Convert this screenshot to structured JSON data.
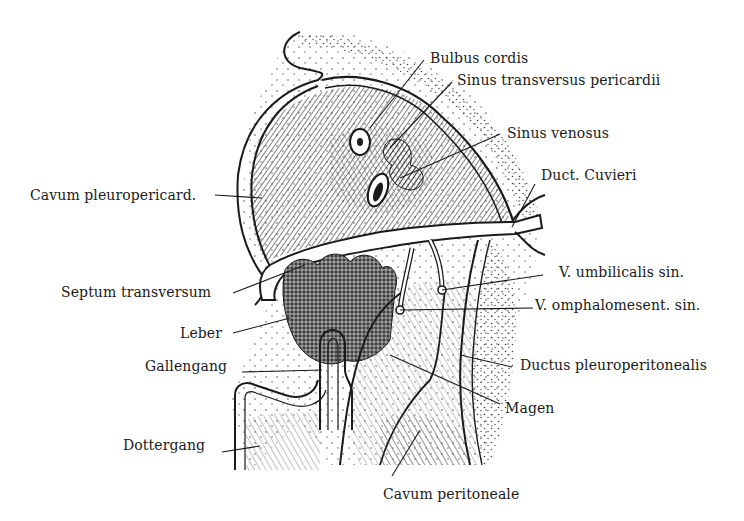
{
  "figure": {
    "type": "anatomical-illustration",
    "labels": [
      {
        "id": "bulbus-cordis",
        "text": "Bulbus cordis",
        "x": 430,
        "y": 50,
        "leader": [
          [
            424,
            60
          ],
          [
            370,
            128
          ]
        ]
      },
      {
        "id": "sinus-transversus-pericardii",
        "text": "Sinus transversus pericardii",
        "x": 457,
        "y": 72,
        "leader": [
          [
            452,
            82
          ],
          [
            390,
            148
          ]
        ]
      },
      {
        "id": "sinus-venosus",
        "text": "Sinus venosus",
        "x": 507,
        "y": 125,
        "leader": [
          [
            500,
            134
          ],
          [
            400,
            178
          ]
        ]
      },
      {
        "id": "duct-cuvieri",
        "text": "Duct. Cuvieri",
        "x": 541,
        "y": 167,
        "leader": [
          [
            535,
            184
          ],
          [
            512,
            227
          ]
        ]
      },
      {
        "id": "cavum-pleuropericard",
        "text": "Cavum pleuropericard.",
        "x": 30,
        "y": 187,
        "leader": [
          [
            215,
            195
          ],
          [
            262,
            198
          ]
        ]
      },
      {
        "id": "v-umbilicalis-sin",
        "text": "V. umbilicalis sin.",
        "x": 559,
        "y": 264,
        "leader": [
          [
            543,
            275
          ],
          [
            442,
            290
          ]
        ]
      },
      {
        "id": "septum-transversum",
        "text": "Septum transversum",
        "x": 61,
        "y": 284,
        "leader": [
          [
            233,
            293
          ],
          [
            305,
            265
          ]
        ]
      },
      {
        "id": "v-omphalomesent-sin",
        "text": "V. omphalomesent. sin.",
        "x": 535,
        "y": 297,
        "leader": [
          [
            533,
            308
          ],
          [
            400,
            310
          ]
        ]
      },
      {
        "id": "leber",
        "text": "Leber",
        "x": 180,
        "y": 325,
        "leader": [
          [
            233,
            333
          ],
          [
            290,
            318
          ]
        ]
      },
      {
        "id": "gallengang",
        "text": "Gallengang",
        "x": 145,
        "y": 358,
        "leader": [
          [
            242,
            372
          ],
          [
            322,
            370
          ]
        ]
      },
      {
        "id": "ductus-pleuroperitonealis",
        "text": "Ductus pleuroperitonealis",
        "x": 520,
        "y": 357,
        "leader": [
          [
            512,
            367
          ],
          [
            460,
            355
          ]
        ]
      },
      {
        "id": "magen",
        "text": "Magen",
        "x": 505,
        "y": 400,
        "leader": [
          [
            500,
            404
          ],
          [
            390,
            355
          ]
        ]
      },
      {
        "id": "dottergang",
        "text": "Dottergang",
        "x": 123,
        "y": 437,
        "leader": [
          [
            222,
            452
          ],
          [
            260,
            446
          ]
        ]
      },
      {
        "id": "cavum-peritoneale",
        "text": "Cavum peritoneale",
        "x": 383,
        "y": 486,
        "leader": [
          [
            392,
            476
          ],
          [
            420,
            430
          ]
        ]
      }
    ]
  },
  "colors": {
    "ink": "#1a1a1a",
    "background": "#ffffff",
    "hatch_dark": "#2a2a2a",
    "hatch_mid": "#6a6a6a",
    "stipple": "#444444"
  }
}
